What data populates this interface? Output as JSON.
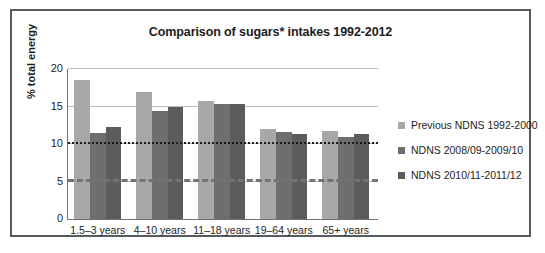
{
  "chart_data": {
    "type": "bar",
    "title": "Comparison of sugars* intakes 1992-2012",
    "xlabel": "",
    "ylabel": "% total energy",
    "ylim": [
      0,
      20
    ],
    "yticks": [
      "0",
      "5",
      "10",
      "15",
      "20"
    ],
    "grid": true,
    "legend_position": "right",
    "categories": [
      "1.5–3 years",
      "4–10 years",
      "11–18 years",
      "19–64 years",
      "65+ years"
    ],
    "series": [
      {
        "name": "Previous NDNS 1992-2000",
        "color": "#a8a8a8",
        "values": [
          18.6,
          17.0,
          15.8,
          12.0,
          11.7
        ]
      },
      {
        "name": "NDNS 2008/09-2009/10",
        "color": "#6e6e6e",
        "values": [
          11.5,
          14.4,
          15.3,
          11.6,
          10.9
        ]
      },
      {
        "name": "NDNS 2010/11-2011/12",
        "color": "#5c5c5c",
        "values": [
          12.3,
          15.0,
          15.3,
          11.4,
          11.4
        ]
      }
    ],
    "reference_lines": [
      {
        "name": "upper-reference",
        "value": 10,
        "style": "dotted",
        "color": "#1b1b1b"
      },
      {
        "name": "lower-reference",
        "value": 5,
        "style": "dashed",
        "color": "#6f7478"
      }
    ]
  },
  "frame": {
    "border_color": "#555b5e"
  }
}
